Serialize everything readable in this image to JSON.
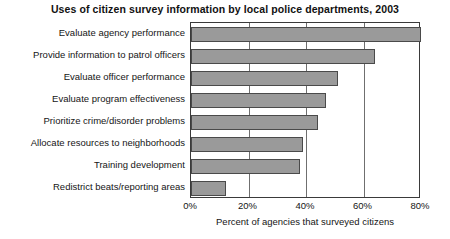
{
  "chart_data": {
    "type": "bar",
    "orientation": "horizontal",
    "title": "Uses of citizen survey information by local police departments, 2003",
    "xlabel": "Percent of agencies that surveyed citizens",
    "ylabel": "",
    "categories": [
      "Evaluate agency performance",
      "Provide information to patrol officers",
      "Evaluate officer performance",
      "Evaluate program effectiveness",
      "Prioritize crime/disorder problems",
      "Allocate resources to neighborhoods",
      "Training development",
      "Redistrict beats/reporting areas"
    ],
    "values": [
      80,
      64,
      51,
      47,
      44,
      39,
      38,
      12
    ],
    "xlim": [
      0,
      80
    ],
    "xticks": [
      0,
      20,
      40,
      60,
      80
    ],
    "xtick_labels": [
      "0%",
      "20%",
      "40%",
      "60%",
      "80%"
    ],
    "grid": "vertical",
    "legend": "none",
    "bar_color": "#9a9a9a",
    "bar_edge_color": "#4a4a4a",
    "axis_color": "#3a3a3a",
    "background": "#ffffff"
  }
}
